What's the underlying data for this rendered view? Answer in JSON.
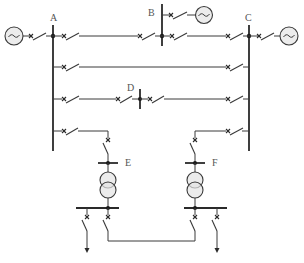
{
  "diagram": {
    "type": "single-line electrical network diagram",
    "labels": {
      "busbar_a": "A",
      "busbar_b": "B",
      "busbar_c": "C",
      "node_d": "D",
      "substation_e": "E",
      "substation_f": "F"
    },
    "symbols": {
      "generator": "~",
      "circuit_breaker": "×",
      "transformer": "two-winding transformer",
      "load": "arrow"
    },
    "colors": {
      "line": "#3a3a3a",
      "generator_fill": "#ececec",
      "transformer_fill": "#e4e4e4",
      "label": "#555555"
    },
    "elements": [
      {
        "id": "gen-left",
        "kind": "generator",
        "connects_to": "A"
      },
      {
        "id": "gen-right",
        "kind": "generator",
        "connects_to": "C"
      },
      {
        "id": "gen-b",
        "kind": "generator",
        "connects_to": "B"
      },
      {
        "id": "line-a-b-c",
        "kind": "line",
        "from": "A",
        "to": "C",
        "via": "B"
      },
      {
        "id": "line-a-c-2",
        "kind": "line",
        "from": "A",
        "to": "C"
      },
      {
        "id": "line-a-d-c",
        "kind": "line",
        "from": "A",
        "to": "C",
        "via": "D"
      },
      {
        "id": "line-a-e",
        "kind": "line",
        "from": "A",
        "to": "E"
      },
      {
        "id": "line-c-f",
        "kind": "line",
        "from": "C",
        "to": "F"
      },
      {
        "id": "tie-e-f",
        "kind": "tie line",
        "from": "E",
        "to": "F"
      },
      {
        "id": "load-e",
        "kind": "load",
        "connects_to": "E"
      },
      {
        "id": "load-f",
        "kind": "load",
        "connects_to": "F"
      }
    ]
  }
}
